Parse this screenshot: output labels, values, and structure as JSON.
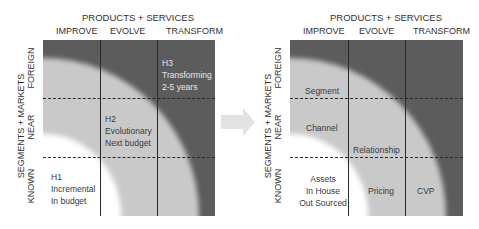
{
  "left_diagram": {
    "title": "PRODUCTS + SERVICES",
    "columns": [
      "IMPROVE",
      "EVOLVE",
      "TRANSFORM"
    ],
    "y_axis_title": "SEGMENTS + MARKETS",
    "rows": [
      "FOREIGN",
      "NEAR",
      "KNOWN"
    ],
    "horizons": {
      "h3": {
        "line1": "H3",
        "line2": "Transforming",
        "line3": "2-5 years"
      },
      "h2": {
        "line1": "H2",
        "line2": "Evolutionary",
        "line3": "Next budget"
      },
      "h1": {
        "line1": "H1",
        "line2": "Incremental",
        "line3": "In budget"
      }
    }
  },
  "arrow": {
    "icon": "right-arrow-icon",
    "color": "#e3e3e3"
  },
  "right_diagram": {
    "title": "PRODUCTS + SERVICES",
    "columns": [
      "IMPROVE",
      "EVOLVE",
      "TRANSFORM"
    ],
    "y_axis_title": "SEGMENTS + MARKETS",
    "rows": [
      "FOREIGN",
      "NEAR",
      "KNOWN"
    ],
    "labels": {
      "segment": "Segment",
      "channel": "Channel",
      "relationship": "Relationship",
      "assets": {
        "line1": "Assets",
        "line2": "In House",
        "line3": "Out Sourced"
      },
      "pricing": "Pricing",
      "cvp": "CVP"
    }
  },
  "colors": {
    "outer_band": "#5c5c5c",
    "middle_band": "#c9c9c9",
    "inner_band": "#ffffff",
    "grid_lines": "#2a2a2a"
  }
}
